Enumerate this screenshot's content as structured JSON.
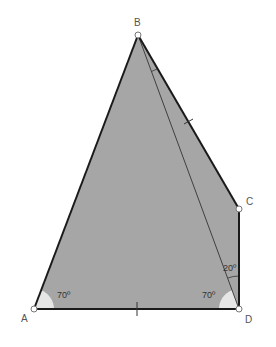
{
  "diagram": {
    "type": "geometry-quadrilateral",
    "colors": {
      "fill": "#a6a6a6",
      "edge": "#1a1a1a",
      "thin_line": "#333333",
      "angle_fill": "#e6e6e6",
      "point_fill": "#ffffff",
      "label": "#555555"
    },
    "points": {
      "A": {
        "label": "A",
        "x": 34,
        "y": 309
      },
      "B": {
        "label": "B",
        "x": 138,
        "y": 35
      },
      "C": {
        "label": "C",
        "x": 239,
        "y": 209
      },
      "D": {
        "label": "D",
        "x": 239,
        "y": 309
      }
    },
    "segments": [
      "AB",
      "BC",
      "CD",
      "DA",
      "BD"
    ],
    "equal_marks": [
      "BC",
      "AD"
    ],
    "angles": [
      {
        "vertex": "A",
        "label": "70º"
      },
      {
        "vertex": "D",
        "between": "A-D-B",
        "label": "70º"
      },
      {
        "vertex": "D",
        "between": "B-D-C",
        "label": "20º"
      }
    ]
  }
}
